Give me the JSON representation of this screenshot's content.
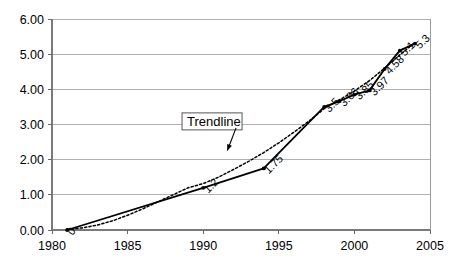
{
  "chart_data": {
    "type": "line",
    "title": "",
    "subtitle": "",
    "xlabel": "",
    "ylabel": "",
    "xlim": [
      1980,
      2005
    ],
    "ylim": [
      0.0,
      6.0
    ],
    "grid": true,
    "legend_position": "none",
    "x_ticks": [
      "1980",
      "1985",
      "1990",
      "1995",
      "2000",
      "2005"
    ],
    "x_tick_values": [
      1980,
      1985,
      1990,
      1995,
      2000,
      2005
    ],
    "y_ticks": [
      "0.00",
      "1.00",
      "2.00",
      "3.00",
      "4.00",
      "5.00",
      "6.00"
    ],
    "y_tick_values": [
      0,
      1,
      2,
      3,
      4,
      5,
      6
    ],
    "series": [
      {
        "name": "data",
        "style": "solid-with-markers",
        "points": [
          {
            "x": 1981,
            "y": 0.0,
            "label": "0"
          },
          {
            "x": 1990,
            "y": 1.2,
            "label": "1.2"
          },
          {
            "x": 1994,
            "y": 1.75,
            "label": "1.75"
          },
          {
            "x": 1998,
            "y": 3.5,
            "label": "3.5"
          },
          {
            "x": 1999,
            "y": 3.66,
            "label": "3.66"
          },
          {
            "x": 2000,
            "y": 3.85,
            "label": "3.85"
          },
          {
            "x": 2001,
            "y": 3.97,
            "label": "3.97"
          },
          {
            "x": 2002,
            "y": 4.58,
            "label": "4.58"
          },
          {
            "x": 2003,
            "y": 5.1,
            "label": "5.1"
          },
          {
            "x": 2004,
            "y": 5.3,
            "label": "5.3"
          }
        ]
      },
      {
        "name": "trendline",
        "style": "dotted",
        "points": [
          {
            "x": 1981.0,
            "y": 0.02
          },
          {
            "x": 1982.0,
            "y": 0.06
          },
          {
            "x": 1983.0,
            "y": 0.14
          },
          {
            "x": 1984.0,
            "y": 0.26
          },
          {
            "x": 1985.0,
            "y": 0.42
          },
          {
            "x": 1986.0,
            "y": 0.6
          },
          {
            "x": 1987.0,
            "y": 0.8
          },
          {
            "x": 1988.0,
            "y": 1.0
          },
          {
            "x": 1989.0,
            "y": 1.2
          },
          {
            "x": 1990.0,
            "y": 1.32
          },
          {
            "x": 1991.0,
            "y": 1.5
          },
          {
            "x": 1992.0,
            "y": 1.72
          },
          {
            "x": 1993.0,
            "y": 1.95
          },
          {
            "x": 1994.0,
            "y": 2.2
          },
          {
            "x": 1995.0,
            "y": 2.48
          },
          {
            "x": 1996.0,
            "y": 2.78
          },
          {
            "x": 1997.0,
            "y": 3.1
          },
          {
            "x": 1998.0,
            "y": 3.45
          },
          {
            "x": 1999.0,
            "y": 3.7
          },
          {
            "x": 2000.0,
            "y": 3.95
          },
          {
            "x": 2001.0,
            "y": 4.25
          },
          {
            "x": 2002.0,
            "y": 4.6
          },
          {
            "x": 2003.0,
            "y": 4.98
          },
          {
            "x": 2004.0,
            "y": 5.33
          }
        ]
      }
    ],
    "annotations": [
      {
        "name": "trendline-callout",
        "text": "Trendline",
        "box_x": 1988.6,
        "box_y": 3.06,
        "arrow_to_x": 1991.6,
        "arrow_to_y": 2.26
      }
    ]
  }
}
